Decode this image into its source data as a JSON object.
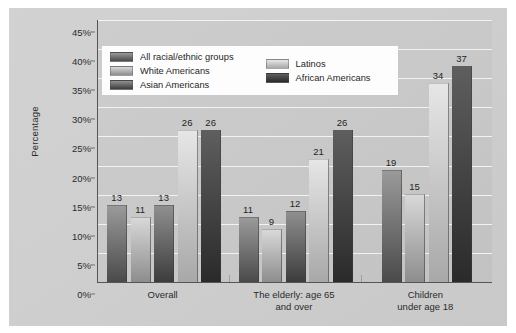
{
  "chart_data": {
    "type": "bar",
    "title": "",
    "xlabel": "",
    "ylabel": "Percentage",
    "ylim": [
      0,
      45
    ],
    "ytick_labels": [
      "0%",
      "5%",
      "10%",
      "15%",
      "20%",
      "25%",
      "30%",
      "35%",
      "40%",
      "45%"
    ],
    "ytick_values": [
      0,
      5,
      10,
      15,
      20,
      25,
      30,
      35,
      40,
      45
    ],
    "grid": true,
    "legend_position": "upper-left-inside",
    "categories": [
      "Overall",
      "The elderly: age 65 and over",
      "Children under age 18"
    ],
    "category_lines": [
      [
        "Overall"
      ],
      [
        "The elderly: age 65",
        "and over"
      ],
      [
        "Children",
        "under age 18"
      ]
    ],
    "series": [
      {
        "name": "All racial/ethnic groups",
        "values": [
          13,
          11,
          19
        ],
        "color_top": "#9a9a9a",
        "color_bottom": "#4a4a4a"
      },
      {
        "name": "White Americans",
        "values": [
          11,
          9,
          15
        ],
        "color_top": "#d8d8d8",
        "color_bottom": "#8d8d8d"
      },
      {
        "name": "Asian Americans",
        "values": [
          13,
          12,
          0
        ],
        "color_top": "#8f8f8f",
        "color_bottom": "#3c3c3c"
      },
      {
        "name": "Latinos",
        "values": [
          26,
          21,
          34
        ],
        "color_top": "#e6e6e6",
        "color_bottom": "#a8a8a8"
      },
      {
        "name": "African Americans",
        "values": [
          26,
          26,
          37
        ],
        "color_top": "#5e5e5e",
        "color_bottom": "#2a2a2a"
      }
    ],
    "data_labels": [
      [
        "13",
        "11",
        "13",
        "26",
        "26"
      ],
      [
        "11",
        "9",
        "12",
        "21",
        "26"
      ],
      [
        "19",
        "15",
        "",
        "34",
        "37"
      ]
    ]
  },
  "legend": {
    "column_1": [
      "All racial/ethnic groups",
      "White Americans",
      "Asian Americans"
    ],
    "column_2": [
      "Latinos",
      "African Americans"
    ]
  },
  "colors": {
    "figure_background": "#cfcfcf",
    "plot_background": "#c8c8c8",
    "gridline": "#f2f2f2",
    "axis": "#555555",
    "text": "#1f1f1f",
    "legend_background": "#fdfdfd"
  }
}
